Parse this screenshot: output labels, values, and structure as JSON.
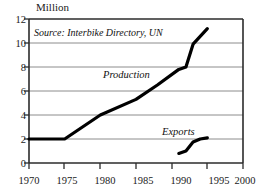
{
  "chart_data": {
    "type": "line",
    "title": "",
    "subtitle": "",
    "ylabel": "Million",
    "xlabel": "",
    "xlim": [
      1970,
      2000
    ],
    "ylim": [
      0,
      12
    ],
    "grid": "horizontal",
    "legend_position": "inline-annotations",
    "xticks": [
      "1970",
      "1975",
      "1980",
      "1985",
      "1990",
      "1995",
      "2000"
    ],
    "yticks": [
      "0",
      "2",
      "4",
      "6",
      "8",
      "10",
      "12"
    ],
    "annotations": [
      {
        "name": "source-note",
        "text": "Source: Interbike Directory, UN",
        "x": 1971.5,
        "y": 11.1
      },
      {
        "name": "production-label",
        "text": "Production",
        "x": 1982.0,
        "y": 7.0
      },
      {
        "name": "exports-label",
        "text": "Exports",
        "x": 1989.6,
        "y": 2.75
      }
    ],
    "series": [
      {
        "name": "Production",
        "color": "#000000",
        "x": [
          1970,
          1975,
          1980,
          1985,
          1988,
          1991,
          1992,
          1993,
          1995
        ],
        "values": [
          2.0,
          2.0,
          4.0,
          5.3,
          6.5,
          7.8,
          8.0,
          9.9,
          11.2
        ]
      },
      {
        "name": "Exports",
        "color": "#000000",
        "x": [
          1991,
          1992,
          1993,
          1994,
          1995
        ],
        "values": [
          0.8,
          1.0,
          1.75,
          2.0,
          2.1
        ]
      }
    ]
  },
  "colors": {
    "frame": "#2b2b2b",
    "gridline": "#8c8c8c",
    "line": "#000000",
    "text": "#1a1a1a",
    "background": "#ffffff"
  }
}
